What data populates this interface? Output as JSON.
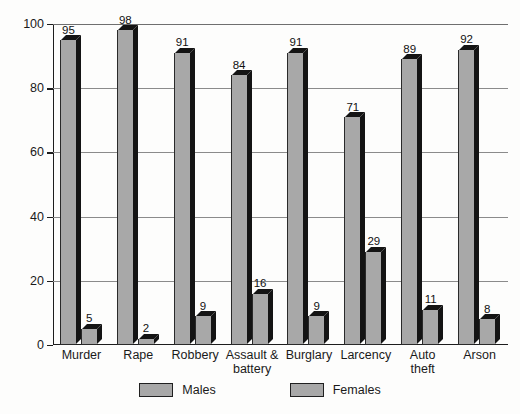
{
  "chart_data": {
    "type": "bar",
    "title": "",
    "subtitle": "",
    "xlabel": "",
    "ylabel": "",
    "ylim": [
      0,
      100
    ],
    "y_ticks": [
      0,
      20,
      40,
      60,
      80,
      100
    ],
    "grid": true,
    "legend_position": "bottom",
    "categories": [
      "Murder",
      "Rape",
      "Robbery",
      "Assault &\nbattery",
      "Burglary",
      "Larcency",
      "Auto\ntheft",
      "Arson"
    ],
    "series": [
      {
        "name": "Males",
        "color": "#a8a8a8",
        "values": [
          95,
          98,
          91,
          84,
          91,
          71,
          89,
          92
        ]
      },
      {
        "name": "Females",
        "color": "#a8a8a8",
        "values": [
          5,
          2,
          9,
          16,
          9,
          29,
          11,
          8
        ]
      }
    ]
  },
  "legend": {
    "items": [
      {
        "label": "Males"
      },
      {
        "label": "Females"
      }
    ]
  },
  "colors": {
    "bar_face": "#a8a8a8",
    "bar_shade": "#141414",
    "axis": "#1d1d1d",
    "gridline": "#8b8b8b",
    "background": "#fdfdfc",
    "text": "#1a1a1a"
  }
}
